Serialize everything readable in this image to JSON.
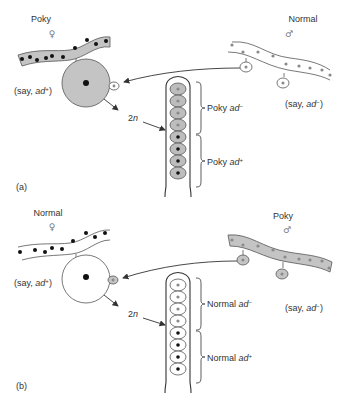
{
  "panel_a": {
    "tag": "(a)",
    "female": {
      "strain": "Poky",
      "sex_symbol": "♀",
      "genotype_prefix": "(say, ",
      "genotype_gene": "ad",
      "genotype_allele": "+",
      "genotype_suffix": ")",
      "cytoplasm": "poky (shaded)"
    },
    "male": {
      "strain": "Normal",
      "sex_symbol": "♂",
      "genotype_prefix": "(say, ",
      "genotype_gene": "ad",
      "genotype_allele": "−",
      "genotype_suffix": ")",
      "cytoplasm": "normal (unshaded)"
    },
    "ploidy_label_num": "2",
    "ploidy_label_n": "n",
    "ascus": {
      "spores": [
        "gray",
        "gray",
        "gray",
        "gray",
        "black",
        "black",
        "black",
        "black"
      ],
      "spore_fill": "#bdbdbd",
      "groups": [
        {
          "strain": "Poky",
          "gene": "ad",
          "allele": "−"
        },
        {
          "strain": "Poky",
          "gene": "ad",
          "allele": "+"
        }
      ]
    }
  },
  "panel_b": {
    "tag": "(b)",
    "female": {
      "strain": "Normal",
      "sex_symbol": "♀",
      "genotype_prefix": "(say, ",
      "genotype_gene": "ad",
      "genotype_allele": "+",
      "genotype_suffix": ")",
      "cytoplasm": "normal (unshaded)"
    },
    "male": {
      "strain": "Poky",
      "sex_symbol": "♂",
      "genotype_prefix": "(say, ",
      "genotype_gene": "ad",
      "genotype_allele": "−",
      "genotype_suffix": ")",
      "cytoplasm": "poky (shaded)"
    },
    "ploidy_label_num": "2",
    "ploidy_label_n": "n",
    "ascus": {
      "spores": [
        "gray",
        "gray",
        "gray",
        "gray",
        "black",
        "black",
        "black",
        "black"
      ],
      "spore_fill": "#ffffff",
      "groups": [
        {
          "strain": "Normal",
          "gene": "ad",
          "allele": "−"
        },
        {
          "strain": "Normal",
          "gene": "ad",
          "allele": "+"
        }
      ]
    }
  },
  "colors": {
    "poky_shade": "#c4c4c4",
    "line": "#444444",
    "nucleus_dark": "#111111",
    "nucleus_gray": "#8a8a8a"
  }
}
